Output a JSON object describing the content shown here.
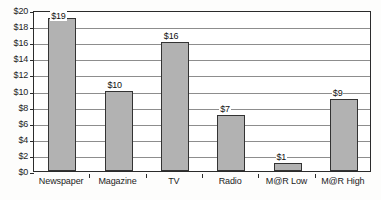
{
  "chart_data": {
    "type": "bar",
    "title": "",
    "subtitle": "",
    "xlabel": "",
    "ylabel": "",
    "categories": [
      "Newspaper",
      "Magazine",
      "TV",
      "Radio",
      "M@R Low",
      "M@R High"
    ],
    "values": [
      19,
      10,
      16,
      7,
      1,
      9
    ],
    "data_labels": [
      "$19",
      "$10",
      "$16",
      "$7",
      "$1",
      "$9"
    ],
    "ylim": [
      0,
      20
    ],
    "ytick_values": [
      0,
      2,
      4,
      6,
      8,
      10,
      12,
      14,
      16,
      18,
      20
    ],
    "ytick_labels": [
      "$0",
      "$2",
      "$4",
      "$6",
      "$8",
      "$10",
      "$12",
      "$14",
      "$16",
      "$18",
      "$20"
    ],
    "grid": true,
    "grid_axis": "y",
    "legend": false,
    "legend_position": "none",
    "bar_fill_color": "#b2b2b2",
    "bar_border_color": "#333333",
    "gridline_color": "#8d8d8d",
    "axis_color": "#2b2b2b",
    "plot_background": "#ffffff",
    "figure_background": "#fdfdfc"
  }
}
